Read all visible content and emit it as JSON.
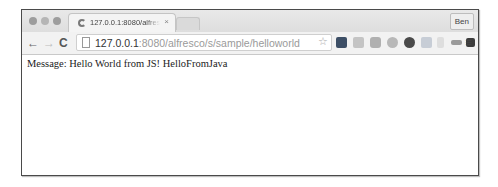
{
  "window": {
    "tab": {
      "title": "127.0.0.1:8080/alfresco/s/sample/helloworld",
      "close_glyph": "×"
    },
    "profile_label": "Ben"
  },
  "toolbar": {
    "back_glyph": "←",
    "forward_glyph": "→",
    "reload_glyph": "C",
    "url_host": "127.0.0.1",
    "url_rest": ":8080/alfresco/s/sample/helloworld",
    "star_glyph": "☆",
    "menu_glyph": "≡",
    "extensions": [
      {
        "name": "extension-1-icon",
        "color": "#3d4f66"
      },
      {
        "name": "extension-2-icon",
        "color": "#c4c4c4"
      },
      {
        "name": "camera-icon",
        "color": "#b0b0b0"
      },
      {
        "name": "extension-4-icon",
        "color": "#b8b8b8"
      },
      {
        "name": "extension-5-icon",
        "color": "#4a4a4a"
      },
      {
        "name": "extension-6-icon",
        "color": "#c7cdd6"
      },
      {
        "name": "extension-7-icon",
        "color": "#dedede"
      },
      {
        "name": "extension-8-icon",
        "color": "#9a9a9a"
      },
      {
        "name": "extension-9-icon",
        "color": "#3c3c3c"
      }
    ]
  },
  "content": {
    "message": "Message: Hello World from JS! HelloFromJava"
  }
}
